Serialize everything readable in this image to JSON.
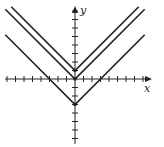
{
  "chart_data": {
    "type": "line",
    "title": "",
    "xlabel": "x",
    "ylabel": "y",
    "xlim": [
      -8.5,
      8.5
    ],
    "ylim": [
      -7.5,
      8.5
    ],
    "grid": false,
    "legend": null,
    "tick_spacing": 1,
    "x_ticks": [
      -8,
      -7,
      -6,
      -5,
      -4,
      -3,
      -2,
      -1,
      1,
      2,
      3,
      4,
      5,
      6,
      7,
      8
    ],
    "y_ticks": [
      -7,
      -6,
      -5,
      -4,
      -3,
      -2,
      -1,
      1,
      2,
      3,
      4,
      5,
      6,
      7,
      8
    ],
    "series": [
      {
        "name": "y = |x| + 1",
        "vertex": [
          0,
          1
        ],
        "x": [
          -7.5,
          0,
          7.5
        ],
        "y": [
          8.5,
          1,
          8.5
        ]
      },
      {
        "name": "y = |x|",
        "vertex": [
          0,
          0
        ],
        "x": [
          -8.2,
          0,
          8.2
        ],
        "y": [
          8.2,
          0,
          8.2
        ]
      },
      {
        "name": "y = |x| - 3",
        "vertex": [
          0,
          -3
        ],
        "x": [
          -8.2,
          0,
          8.2
        ],
        "y": [
          5.2,
          -3,
          5.2
        ]
      }
    ],
    "color": "#222222"
  }
}
